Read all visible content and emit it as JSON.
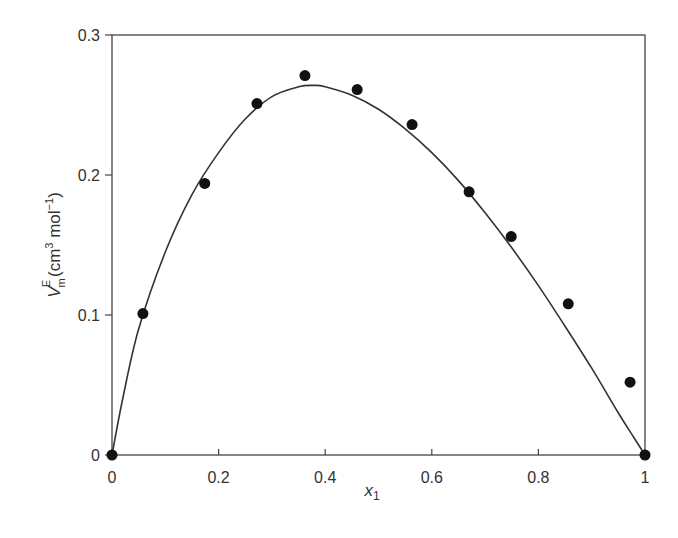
{
  "chart_data": {
    "type": "scatter",
    "title": "",
    "xlabel": "x1",
    "xlabel_main": "x",
    "xlabel_sub": "1",
    "ylabel": "V_m^E (cm3 mol-1)",
    "ylabel_parts": {
      "symbol": "V",
      "sub": "m",
      "sup": "E",
      "unit_open": "(cm",
      "unit_pow": "3",
      "unit_mid": " mol",
      "unit_exp": "−1",
      "unit_close": ")"
    },
    "xlim": [
      0,
      1
    ],
    "ylim": [
      0,
      0.3
    ],
    "xticks": [
      0,
      0.2,
      0.4,
      0.6,
      0.8,
      1
    ],
    "xtick_labels": [
      "0",
      "0.2",
      "0.4",
      "0.6",
      "0.8",
      "1"
    ],
    "yticks": [
      0,
      0.1,
      0.2,
      0.3
    ],
    "ytick_labels": [
      "0",
      "0.1",
      "0.2",
      "0.3"
    ],
    "grid": false,
    "legend": null,
    "series": [
      {
        "name": "experimental",
        "kind": "markers",
        "x": [
          0,
          0.058,
          0.174,
          0.272,
          0.362,
          0.46,
          0.563,
          0.67,
          0.749,
          0.856,
          0.972,
          1.0
        ],
        "y": [
          0,
          0.101,
          0.194,
          0.251,
          0.271,
          0.261,
          0.236,
          0.188,
          0.156,
          0.108,
          0.052,
          0
        ]
      },
      {
        "name": "fitted curve",
        "kind": "line",
        "x": [
          0,
          0.02,
          0.05,
          0.1,
          0.15,
          0.2,
          0.25,
          0.3,
          0.35,
          0.38,
          0.4,
          0.45,
          0.5,
          0.55,
          0.6,
          0.65,
          0.7,
          0.75,
          0.8,
          0.85,
          0.9,
          0.95,
          0.98,
          1.0
        ],
        "y": [
          0,
          0.04,
          0.09,
          0.145,
          0.186,
          0.216,
          0.24,
          0.256,
          0.263,
          0.264,
          0.263,
          0.257,
          0.247,
          0.233,
          0.216,
          0.196,
          0.173,
          0.148,
          0.121,
          0.092,
          0.062,
          0.03,
          0.012,
          0
        ]
      }
    ]
  }
}
